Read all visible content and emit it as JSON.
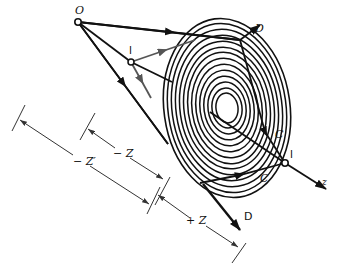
{
  "diagram": {
    "title": "",
    "colors": {
      "line": "#111111",
      "gray_line": "#555555",
      "background": "#ffffff"
    },
    "labels": {
      "source_point": "O",
      "virtual_point": "I",
      "image_point": "I",
      "axis": "z",
      "diffracted_upper": "D",
      "diffracted_lower": "D",
      "converging_upper": "C",
      "converging_lower": "C",
      "dim_neg_z": "− Z",
      "dim_neg_z_prime": "− Z′",
      "dim_pos_z": "+ Z"
    },
    "zone_plate": {
      "rings": 14,
      "center": [
        227,
        108
      ],
      "outer_rx": 63,
      "outer_ry": 90
    }
  }
}
